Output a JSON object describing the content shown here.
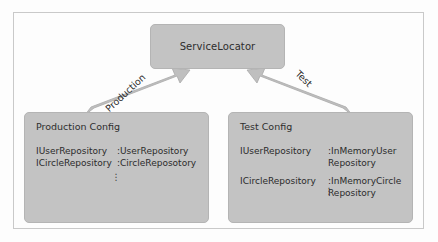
{
  "diagram": {
    "nodes": {
      "service_locator": {
        "title": "ServiceLocator"
      },
      "production_config": {
        "title": "Production Config",
        "rows": [
          {
            "interface": "IUserRepository",
            "impl": ":UserRepository"
          },
          {
            "interface": "ICircleRepository",
            "impl": ":CircleReposotory"
          }
        ],
        "ellipsis": "⋮"
      },
      "test_config": {
        "title": "Test Config",
        "rows": [
          {
            "interface": "IUserRepository",
            "impl": ":InMemoryUser\nRepository"
          },
          {
            "interface": "ICircleRepository",
            "impl": ":InMemoryCircle\nRepository"
          }
        ],
        "ellipsis": "⋮"
      }
    },
    "edges": [
      {
        "label": "Production",
        "from": "production_config",
        "to": "service_locator"
      },
      {
        "label": "Test",
        "from": "test_config",
        "to": "service_locator"
      }
    ],
    "colors": {
      "node_fill": "#c3c3c3",
      "node_border": "#b4b4b4",
      "arrow_fill": "#bfbfbf",
      "arrow_border": "#a8a8a8",
      "frame_border": "#c9c9c9",
      "background": "#fdfdfd",
      "text": "#2b2b2b"
    }
  }
}
